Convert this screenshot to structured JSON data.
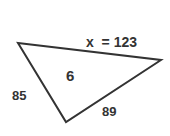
{
  "diagram": {
    "shape": "triangle",
    "vertices": [
      [
        18,
        43
      ],
      [
        161,
        60
      ],
      [
        66,
        122
      ]
    ],
    "stroke_color": "#333333",
    "labels": {
      "top_side": "x  = 123",
      "center": "6",
      "left_side": "85",
      "bottom_side": "89"
    }
  }
}
